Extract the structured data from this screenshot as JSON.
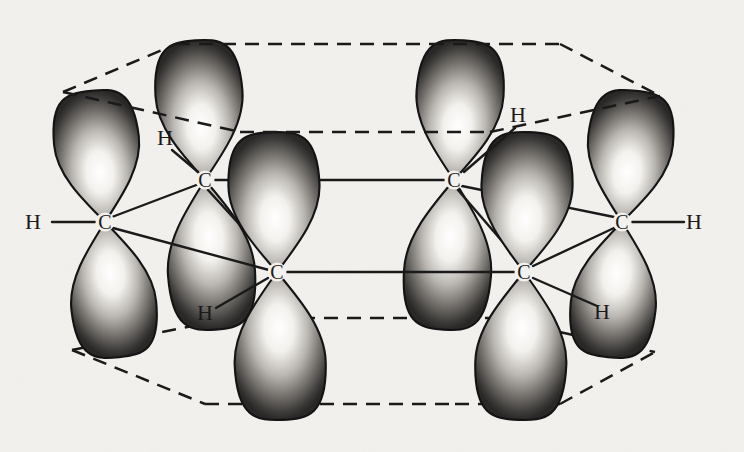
{
  "figure": {
    "molecule": "benzene",
    "background_color": "#f3f1ed",
    "ink_color": "#1a1a1a",
    "lobe_outline_color": "#141414",
    "lobe_dark_color": "#4a4a4a",
    "lobe_light_color": "#f4f2ee"
  },
  "atom_labels": {
    "carbon": "C",
    "hydrogen": "H"
  },
  "atoms": [
    {
      "id": "c1",
      "element": "C",
      "x": 105,
      "y": 222,
      "ring_position": "front-left"
    },
    {
      "id": "c2",
      "element": "C",
      "x": 205,
      "y": 180,
      "ring_position": "back-left"
    },
    {
      "id": "c3",
      "element": "C",
      "x": 277,
      "y": 272,
      "ring_position": "front-left-lower"
    },
    {
      "id": "c4",
      "element": "C",
      "x": 454,
      "y": 180,
      "ring_position": "back-right"
    },
    {
      "id": "c5",
      "element": "C",
      "x": 524,
      "y": 272,
      "ring_position": "front-right-lower"
    },
    {
      "id": "c6",
      "element": "C",
      "x": 622,
      "y": 222,
      "ring_position": "front-right"
    }
  ],
  "hydrogens": [
    {
      "id": "h1",
      "element": "H",
      "x": 33,
      "y": 222,
      "bond_to": "c1",
      "bond": {
        "x1": 52,
        "y1": 222,
        "x2": 95,
        "y2": 222
      }
    },
    {
      "id": "h2",
      "element": "H",
      "x": 165,
      "y": 138,
      "bond_to": "c2",
      "bond": {
        "x1": 172,
        "y1": 150,
        "x2": 198,
        "y2": 172
      }
    },
    {
      "id": "h3",
      "element": "H",
      "x": 205,
      "y": 313,
      "bond_to": "c3",
      "bond": {
        "x1": 216,
        "y1": 308,
        "x2": 268,
        "y2": 278
      }
    },
    {
      "id": "h4",
      "element": "H",
      "x": 518,
      "y": 115,
      "bond_to": "c4",
      "bond": {
        "x1": 515,
        "y1": 128,
        "x2": 464,
        "y2": 172
      }
    },
    {
      "id": "h5",
      "element": "H",
      "x": 602,
      "y": 312,
      "bond_to": "c5",
      "bond": {
        "x1": 597,
        "y1": 306,
        "x2": 533,
        "y2": 278
      }
    },
    {
      "id": "h6",
      "element": "H",
      "x": 694,
      "y": 222,
      "bond_to": "c6",
      "bond": {
        "x1": 632,
        "y1": 222,
        "x2": 684,
        "y2": 222
      }
    }
  ],
  "sigma_bonds": [
    {
      "from": "c1",
      "to": "c2",
      "x1": 112,
      "y1": 217,
      "x2": 199,
      "y2": 184
    },
    {
      "from": "c1",
      "to": "c3",
      "x1": 113,
      "y1": 228,
      "x2": 269,
      "y2": 270
    },
    {
      "from": "c2",
      "to": "c4",
      "x1": 215,
      "y1": 180,
      "x2": 444,
      "y2": 180
    },
    {
      "from": "c3",
      "to": "c5",
      "x1": 287,
      "y1": 272,
      "x2": 514,
      "y2": 272
    },
    {
      "from": "c4",
      "to": "c6",
      "x1": 462,
      "y1": 186,
      "x2": 614,
      "y2": 217
    },
    {
      "from": "c5",
      "to": "c6",
      "x1": 533,
      "y1": 266,
      "x2": 614,
      "y2": 228
    },
    {
      "from": "c2",
      "to": "c3",
      "x1": 208,
      "y1": 190,
      "x2": 274,
      "y2": 262
    },
    {
      "from": "c4",
      "to": "c5",
      "x1": 458,
      "y1": 190,
      "x2": 520,
      "y2": 262
    }
  ],
  "p_orbitals": [
    {
      "atom": "c1",
      "cx": 105,
      "cy": 222,
      "angle": -6,
      "upper_len": 132,
      "lower_len": 136,
      "width": 86,
      "layer": "mid"
    },
    {
      "atom": "c2",
      "cx": 205,
      "cy": 180,
      "angle": -4,
      "upper_len": 140,
      "lower_len": 150,
      "width": 88,
      "layer": "back"
    },
    {
      "atom": "c3",
      "cx": 277,
      "cy": 272,
      "angle": -2,
      "upper_len": 140,
      "lower_len": 148,
      "width": 92,
      "layer": "front"
    },
    {
      "atom": "c4",
      "cx": 454,
      "cy": 180,
      "angle": 4,
      "upper_len": 140,
      "lower_len": 150,
      "width": 88,
      "layer": "back"
    },
    {
      "atom": "c5",
      "cx": 524,
      "cy": 272,
      "angle": 2,
      "upper_len": 140,
      "lower_len": 148,
      "width": 92,
      "layer": "front"
    },
    {
      "atom": "c6",
      "cx": 622,
      "cy": 222,
      "angle": 6,
      "upper_len": 132,
      "lower_len": 136,
      "width": 86,
      "layer": "mid"
    }
  ],
  "envelope_dashed_lines": {
    "style": "dashed",
    "dash_pattern": "14 9",
    "upper": [
      {
        "x1": 63,
        "y1": 92,
        "x2": 176,
        "y2": 44
      },
      {
        "x1": 176,
        "y1": 44,
        "x2": 430,
        "y2": 44
      },
      {
        "x1": 430,
        "y1": 44,
        "x2": 560,
        "y2": 44
      },
      {
        "x1": 560,
        "y1": 44,
        "x2": 660,
        "y2": 96
      },
      {
        "x1": 63,
        "y1": 92,
        "x2": 240,
        "y2": 132
      },
      {
        "x1": 240,
        "y1": 132,
        "x2": 490,
        "y2": 132
      },
      {
        "x1": 490,
        "y1": 132,
        "x2": 660,
        "y2": 96
      }
    ],
    "lower": [
      {
        "x1": 72,
        "y1": 350,
        "x2": 205,
        "y2": 404
      },
      {
        "x1": 205,
        "y1": 404,
        "x2": 455,
        "y2": 404
      },
      {
        "x1": 455,
        "y1": 404,
        "x2": 560,
        "y2": 404
      },
      {
        "x1": 560,
        "y1": 404,
        "x2": 655,
        "y2": 352
      },
      {
        "x1": 72,
        "y1": 350,
        "x2": 232,
        "y2": 318
      },
      {
        "x1": 232,
        "y1": 318,
        "x2": 492,
        "y2": 318
      },
      {
        "x1": 492,
        "y1": 318,
        "x2": 655,
        "y2": 352
      }
    ]
  }
}
